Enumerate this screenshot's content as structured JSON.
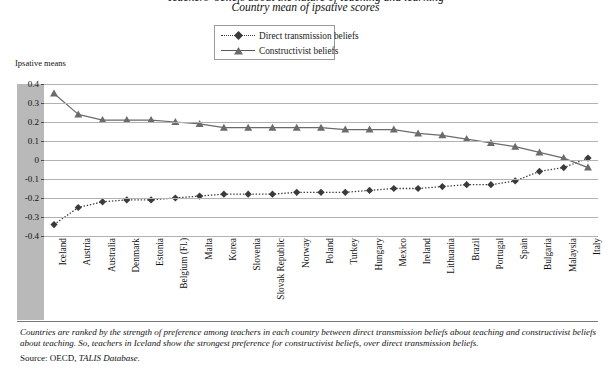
{
  "titles": {
    "clipped_top": "Teachers' beliefs about the nature of teaching and learning",
    "subtitle": "Country mean of ipsative scores"
  },
  "legend": {
    "position": "top-center",
    "items": [
      {
        "label": "Direct transmission beliefs",
        "marker": "diamond",
        "style": "dotted",
        "color": "#3a3a3a"
      },
      {
        "label": "Constructivist beliefs",
        "marker": "triangle",
        "style": "solid",
        "color": "#6b6b6b"
      }
    ]
  },
  "axis": {
    "ylabel": "Ipsative means",
    "yticks": [
      "0.4",
      "0.3",
      "0.2",
      "0.1",
      "0",
      "-0.1",
      "-0.2",
      "-0.3",
      "-0.4"
    ]
  },
  "footer": {
    "note": "Countries are ranked by the strength of preference among teachers in each country between direct transmission beliefs about teaching and constructivist beliefs about teaching. So, teachers in Iceland show the strongest preference for constructivist beliefs, over direct transmission beliefs.",
    "source_prefix": "Source: OECD, ",
    "source_db": "TALIS Database."
  },
  "chart_data": {
    "type": "line",
    "title": "Teachers' beliefs about the nature of teaching and learning",
    "subtitle": "Country mean of ipsative scores",
    "xlabel": "",
    "ylabel": "Ipsative means",
    "ylim": [
      -0.4,
      0.4
    ],
    "ytick_step": 0.1,
    "grid": true,
    "legend_position": "top-center",
    "categories": [
      "Iceland",
      "Austria",
      "Australia",
      "Denmark",
      "Estonia",
      "Belgium (Fl.)",
      "Malta",
      "Korea",
      "Slovenia",
      "Slovak Republic",
      "Norway",
      "Poland",
      "Turkey",
      "Hungary",
      "Mexico",
      "Ireland",
      "Lithuania",
      "Brazil",
      "Portugal",
      "Spain",
      "Bulgaria",
      "Malaysia",
      "Italy"
    ],
    "series": [
      {
        "name": "Direct transmission beliefs",
        "marker": "diamond",
        "linestyle": "dotted",
        "color": "#3a3a3a",
        "values": [
          -0.34,
          -0.25,
          -0.22,
          -0.21,
          -0.21,
          -0.2,
          -0.19,
          -0.18,
          -0.18,
          -0.18,
          -0.17,
          -0.17,
          -0.17,
          -0.16,
          -0.15,
          -0.15,
          -0.14,
          -0.13,
          -0.13,
          -0.11,
          -0.06,
          -0.04,
          0.01
        ]
      },
      {
        "name": "Constructivist beliefs",
        "marker": "triangle",
        "linestyle": "solid",
        "color": "#6b6b6b",
        "values": [
          0.35,
          0.24,
          0.21,
          0.21,
          0.21,
          0.2,
          0.19,
          0.17,
          0.17,
          0.17,
          0.17,
          0.17,
          0.16,
          0.16,
          0.16,
          0.14,
          0.13,
          0.11,
          0.09,
          0.07,
          0.04,
          0.01,
          -0.04
        ]
      }
    ]
  }
}
